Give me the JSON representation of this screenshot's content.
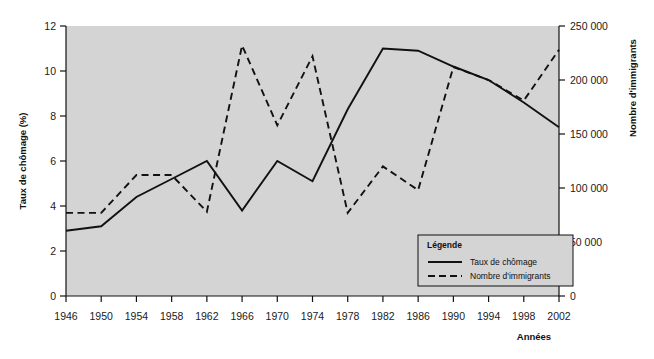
{
  "chart_data": {
    "type": "line",
    "title": "",
    "xlabel": "Années",
    "ylabel": "Taux de chômage (%)",
    "y2label": "Nombre d'immigrants",
    "grid": false,
    "legend_position": "inside-bottom-right",
    "legend_title": "Légende",
    "categories": [
      "1946",
      "1950",
      "1954",
      "1958",
      "1962",
      "1966",
      "1970",
      "1974",
      "1978",
      "1982",
      "1986",
      "1990",
      "1994",
      "1998",
      "2002"
    ],
    "x": [
      1946,
      1950,
      1954,
      1958,
      1962,
      1966,
      1970,
      1974,
      1978,
      1982,
      1986,
      1990,
      1994,
      1998,
      2002
    ],
    "ylim": [
      0,
      12
    ],
    "yticks": [
      "0",
      "2",
      "4",
      "6",
      "8",
      "10",
      "12"
    ],
    "y2lim": [
      0,
      250000
    ],
    "y2ticks": [
      "0",
      "50 000",
      "100 000",
      "150 000",
      "200 000",
      "250 000"
    ],
    "series": [
      {
        "name": "Taux de chômage",
        "axis": "left",
        "style": "solid",
        "color": "#111111",
        "values": [
          2.9,
          3.1,
          4.4,
          5.2,
          6.0,
          3.8,
          6.0,
          5.1,
          8.3,
          11.0,
          10.9,
          10.2,
          9.6,
          8.6,
          7.5
        ]
      },
      {
        "name": "Nombre d'immigrants",
        "axis": "right",
        "style": "dashed",
        "color": "#111111",
        "values": [
          77000,
          77000,
          112000,
          112000,
          78000,
          232000,
          158000,
          222000,
          77000,
          120000,
          98000,
          212000,
          200000,
          181000,
          228000
        ]
      }
    ]
  },
  "legend": {
    "title": "Légende",
    "items": [
      {
        "label": "Taux de chômage",
        "style": "solid"
      },
      {
        "label": "Nombre d'immigrants",
        "style": "dashed"
      }
    ]
  },
  "colors": {
    "plot_background": "#d4d4d4",
    "axis": "#111111",
    "line": "#111111",
    "legend_background": "#d4d4d4",
    "legend_border": "#111111"
  }
}
